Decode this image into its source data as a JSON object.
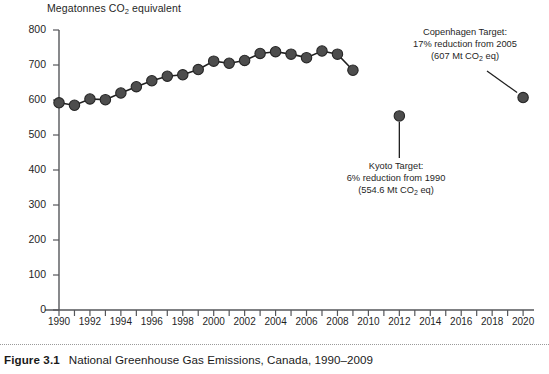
{
  "figure": {
    "caption_label": "Figure 3.1",
    "caption_text": "National Greenhouse Gas Emissions, Canada, 1990–2009"
  },
  "chart_data": {
    "type": "line",
    "title": "",
    "ylabel": "Megatonnes CO₂ equivalent",
    "xlabel": "",
    "ylim": [
      0,
      800
    ],
    "xlim": [
      1989.5,
      2020.5
    ],
    "ytick_step": 100,
    "xtick_step": 1,
    "grid": false,
    "legend": "none",
    "yticks": [
      0,
      100,
      200,
      300,
      400,
      500,
      600,
      700,
      800
    ],
    "xticks_labeled": [
      1990,
      1992,
      1994,
      1996,
      1998,
      2000,
      2002,
      2004,
      2006,
      2008,
      2010,
      2012,
      2014,
      2016,
      2018,
      2020
    ],
    "series": [
      {
        "name": "National greenhouse gas emissions",
        "marker": "filled-circle",
        "color": "#4d4d4d",
        "x": [
          1990,
          1991,
          1992,
          1993,
          1994,
          1995,
          1996,
          1997,
          1998,
          1999,
          2000,
          2001,
          2002,
          2003,
          2004,
          2005,
          2006,
          2007,
          2008,
          2009
        ],
        "values": [
          592,
          585,
          603,
          601,
          620,
          638,
          655,
          668,
          672,
          687,
          711,
          705,
          713,
          733,
          738,
          731,
          721,
          740,
          731,
          685
        ]
      },
      {
        "name": "Kyoto Target",
        "marker": "filled-circle",
        "color": "#4d4d4d",
        "x": [
          2012
        ],
        "values": [
          554.6
        ]
      },
      {
        "name": "Copenhagen Target",
        "marker": "filled-circle",
        "color": "#4d4d4d",
        "x": [
          2020
        ],
        "values": [
          607
        ]
      }
    ],
    "annotations": [
      {
        "id": "kyoto",
        "lines": [
          "Kyoto Target:",
          "6% reduction from 1990",
          "(554.6 Mt CO₂ eq)"
        ],
        "line1": "Kyoto Target:",
        "line2": "6% reduction from 1990",
        "line3_prefix": "(554.6 Mt CO",
        "line3_sub": "2",
        "line3_suffix": " eq)",
        "points_to": {
          "x": 2012,
          "y": 554.6
        }
      },
      {
        "id": "copenhagen",
        "lines": [
          "Copenhagen Target:",
          "17% reduction from 2005",
          "(607 Mt CO₂ eq)"
        ],
        "line1": "Copenhagen Target:",
        "line2": "17% reduction from 2005",
        "line3_prefix": "(607 Mt CO",
        "line3_sub": "2",
        "line3_suffix": " eq)",
        "points_to": {
          "x": 2020,
          "y": 607
        }
      }
    ],
    "axis_title_prefix": "Megatonnes CO",
    "axis_title_sub": "2",
    "axis_title_suffix": " equivalent",
    "colors": {
      "marker": "#4d4d4d",
      "marker_edge": "#262626",
      "line": "#1f1f1f",
      "axis": "#55565a",
      "text": "#1f1f1f",
      "background": "#ffffff"
    }
  }
}
